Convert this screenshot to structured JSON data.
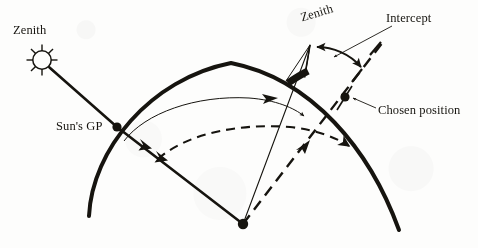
{
  "figure": {
    "width": 478,
    "height": 248,
    "background_color": "#fdfdfc",
    "ink_color": "#16140f"
  },
  "labels": {
    "zenith_sun": "Zenith",
    "zenith_observer": "Zenith",
    "intercept": "Intercept",
    "chosen_position": "Chosen position",
    "suns_gp": "Sun's GP"
  },
  "icons": {
    "sun": "sun-icon",
    "sun_ray_count": 8
  },
  "points": {
    "earth_center": {
      "x": 243,
      "y": 224,
      "marker": "filled-dot"
    },
    "suns_gp": {
      "x": 117,
      "y": 127,
      "marker": "filled-dot"
    },
    "chosen_position": {
      "x": 345,
      "y": 97,
      "marker": "filled-dot"
    },
    "observed_position": {
      "x": 302,
      "y": 76,
      "marker": "thick-bar"
    },
    "sun_center": {
      "x": 42,
      "y": 60
    },
    "zenith_observer_apex": {
      "x": 310,
      "y": 45
    },
    "intercept_end": {
      "x": 363,
      "y": 71
    }
  },
  "curves": {
    "earth_surface": {
      "name": "earth-surface-arc",
      "stroke_width": 4.0,
      "style": "solid",
      "description": "Thick arc representing the curved surface of the Earth"
    },
    "zenith_distance_arc_computed": {
      "name": "computed-zenith-distance-arc",
      "stroke_width": 1.0,
      "style": "solid",
      "description": "Thin arc from Sun's GP sweeping to the observed position"
    },
    "zenith_distance_arc_observed": {
      "name": "observed-zenith-distance-arc",
      "stroke_width": 2.0,
      "style": "dashed",
      "description": "Dashed arc from the Sun's GP ray sweeping to the chosen position ray"
    }
  },
  "lines": {
    "sun_ray": {
      "name": "sun-ray-line",
      "style": "solid",
      "stroke_width": 2.6,
      "from": "sun_center",
      "to": "suns_gp"
    },
    "gp_to_center": {
      "name": "gp-to-earth-center-line",
      "style": "solid",
      "stroke_width": 2.6,
      "from": "suns_gp",
      "to": "earth_center"
    },
    "center_to_observed": {
      "name": "center-to-observed-position-line",
      "style": "solid",
      "stroke_width": 1.1,
      "from": "earth_center",
      "to": "zenith_observer_apex"
    },
    "center_to_chosen": {
      "name": "center-to-chosen-position-line",
      "style": "dashed",
      "stroke_width": 2.4,
      "from": "earth_center",
      "to": "chosen_position"
    }
  },
  "arrows": {
    "intercept_arc": {
      "name": "intercept-measure-arrow",
      "style": "double-headed",
      "description": "Curved double-headed arrow spanning the intercept distance"
    },
    "intercept_pointer": {
      "name": "intercept-label-leader",
      "style": "single-headed"
    },
    "chosen_position_pointer": {
      "name": "chosen-position-label-leader",
      "style": "single-headed"
    },
    "computed_arc_head": {
      "name": "computed-arc-arrowhead",
      "style": "single-headed"
    },
    "observed_arc_head": {
      "name": "observed-arc-arrowhead",
      "style": "single-headed"
    }
  }
}
